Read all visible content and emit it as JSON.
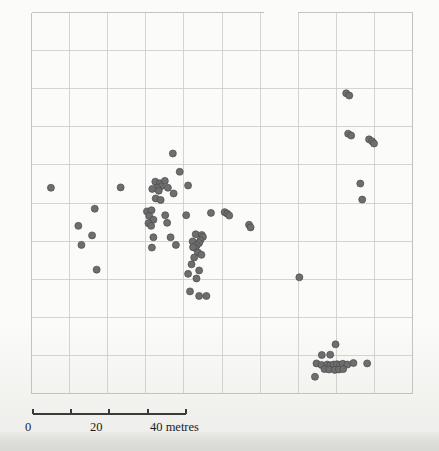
{
  "figure": {
    "kind": "archaeological-distribution-plan",
    "background_color": "#fbfbf9",
    "grid_color": "#c9c9c9",
    "point_color": "#6e6e6e",
    "point_edge_color": "#4a4a4a"
  },
  "scalebar": {
    "name": "scale-bar",
    "unit_label": "40 metres",
    "tick_labels": [
      "0",
      "20",
      "40 metres"
    ],
    "ticks": [
      0,
      10,
      20,
      30,
      40
    ],
    "min": 0,
    "max": 40,
    "pixels_per_unit": 3.82
  },
  "chart_data": {
    "type": "scatter",
    "title": "",
    "subtitle": "",
    "xlabel": "",
    "ylabel": "",
    "legend": [],
    "grid": true,
    "grid_spacing_metres": 10,
    "axis_units": "metres",
    "xlim": [
      0,
      100
    ],
    "ylim": [
      0,
      100
    ],
    "series": [
      {
        "name": "finds",
        "marker": "circle",
        "color": "#6e6e6e",
        "count": 95,
        "points": [
          [
            5.1,
            54.0
          ],
          [
            23.4,
            54.1
          ],
          [
            12.3,
            44.0
          ],
          [
            16.6,
            48.5
          ],
          [
            13.1,
            39.0
          ],
          [
            15.9,
            41.5
          ],
          [
            17.1,
            32.5
          ],
          [
            37.1,
            63.0
          ],
          [
            38.9,
            58.2
          ],
          [
            32.5,
            55.6
          ],
          [
            33.7,
            55.2
          ],
          [
            35.0,
            55.8
          ],
          [
            34.0,
            54.4
          ],
          [
            33.0,
            54.0
          ],
          [
            31.7,
            53.7
          ],
          [
            33.4,
            53.2
          ],
          [
            35.8,
            54.0
          ],
          [
            32.6,
            51.2
          ],
          [
            33.9,
            50.8
          ],
          [
            37.3,
            52.5
          ],
          [
            41.1,
            54.6
          ],
          [
            30.3,
            47.8
          ],
          [
            31.5,
            48.1
          ],
          [
            30.9,
            46.6
          ],
          [
            32.0,
            45.6
          ],
          [
            30.7,
            44.7
          ],
          [
            31.4,
            44.0
          ],
          [
            35.1,
            46.8
          ],
          [
            35.6,
            44.8
          ],
          [
            40.6,
            46.8
          ],
          [
            32.0,
            41.0
          ],
          [
            36.5,
            41.0
          ],
          [
            31.6,
            38.3
          ],
          [
            37.9,
            39.0
          ],
          [
            43.1,
            41.8
          ],
          [
            42.3,
            39.9
          ],
          [
            44.7,
            41.6
          ],
          [
            45.0,
            41.1
          ],
          [
            44.3,
            40.2
          ],
          [
            44.0,
            39.5
          ],
          [
            43.4,
            38.9
          ],
          [
            43.0,
            38.2
          ],
          [
            42.4,
            38.4
          ],
          [
            43.7,
            37.0
          ],
          [
            44.6,
            36.4
          ],
          [
            42.7,
            35.7
          ],
          [
            42.0,
            33.9
          ],
          [
            44.0,
            32.3
          ],
          [
            47.1,
            47.4
          ],
          [
            50.7,
            47.6
          ],
          [
            51.4,
            47.2
          ],
          [
            51.9,
            46.7
          ],
          [
            57.1,
            44.3
          ],
          [
            57.5,
            43.6
          ],
          [
            41.1,
            31.4
          ],
          [
            43.3,
            30.2
          ],
          [
            41.6,
            26.8
          ],
          [
            44.0,
            25.6
          ],
          [
            45.9,
            25.6
          ],
          [
            70.3,
            30.5
          ],
          [
            86.3,
            55.1
          ],
          [
            86.8,
            50.9
          ],
          [
            82.6,
            78.8
          ],
          [
            83.4,
            78.2
          ],
          [
            83.1,
            68.2
          ],
          [
            83.9,
            67.7
          ],
          [
            88.6,
            66.7
          ],
          [
            89.4,
            66.2
          ],
          [
            89.9,
            65.6
          ],
          [
            79.8,
            12.9
          ],
          [
            76.2,
            10.1
          ],
          [
            78.4,
            10.2
          ],
          [
            74.8,
            7.9
          ],
          [
            76.1,
            7.5
          ],
          [
            77.6,
            7.6
          ],
          [
            78.4,
            7.4
          ],
          [
            79.3,
            7.6
          ],
          [
            80.2,
            7.7
          ],
          [
            81.0,
            7.5
          ],
          [
            81.7,
            7.8
          ],
          [
            82.9,
            7.6
          ],
          [
            84.5,
            8.0
          ],
          [
            88.1,
            7.9
          ],
          [
            76.9,
            6.4
          ],
          [
            78.1,
            6.3
          ],
          [
            79.6,
            6.2
          ],
          [
            80.7,
            6.3
          ],
          [
            81.8,
            6.4
          ],
          [
            74.4,
            4.4
          ]
        ]
      }
    ]
  }
}
